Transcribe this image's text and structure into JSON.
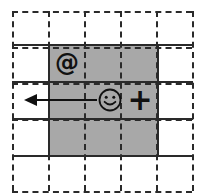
{
  "figure": {
    "title": "",
    "background_color": "#ffffff",
    "observable_region_color": "#a8a8a8",
    "line_color": "#2a2a2a"
  },
  "world_grid": {
    "description": "dashed outer grid",
    "columns": 5,
    "rows": 5,
    "cell_width": 36,
    "cell_height": 36,
    "origin_x": 12,
    "origin_y": 11,
    "line_style": "dashed"
  },
  "inner_grid": {
    "description": "solid grid lines spanning the figure",
    "line_style": "solid",
    "horizontal_y": [
      44,
      81,
      118,
      155
    ],
    "vertical_x": [
      48,
      157
    ],
    "horizontal_span": [
      12,
      193
    ],
    "vertical_span": [
      44,
      155
    ]
  },
  "observable_region": {
    "label": "observable region",
    "x": 48,
    "y": 44,
    "width": 109,
    "height": 111,
    "columns": 3,
    "rows": 3
  },
  "objects": [
    {
      "name": "at-symbol",
      "glyph": "@",
      "cell_col": 0,
      "cell_row": 0,
      "center_x": 67,
      "center_y": 63,
      "font_size": 24
    },
    {
      "name": "agent-smiley",
      "glyph": "☺",
      "cell_col": 1,
      "cell_row": 1,
      "center_x": 110,
      "center_y": 100,
      "radius": 11
    },
    {
      "name": "plus-symbol",
      "glyph": "+",
      "cell_col": 2,
      "cell_row": 1,
      "center_x": 140,
      "center_y": 100,
      "font_size": 30
    }
  ],
  "arrow": {
    "name": "movement-arrow",
    "direction": "left",
    "start_x": 97,
    "start_y": 100,
    "end_x": 24,
    "end_y": 100,
    "head_length": 13,
    "head_width": 12,
    "line_width": 2,
    "color": "#111111"
  }
}
